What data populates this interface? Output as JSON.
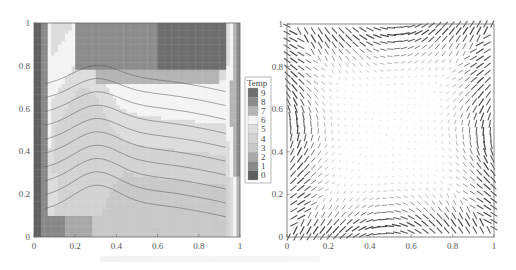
{
  "chart_data": [
    {
      "type": "heatmap",
      "subtype": "filled-contour",
      "title": "",
      "xlabel": "",
      "ylabel": "",
      "xlim": [
        0,
        1
      ],
      "ylim": [
        0,
        1
      ],
      "xticks": [
        "0",
        "0.2",
        "0.4",
        "0.6",
        "0.8",
        "1"
      ],
      "yticks": [
        "0",
        "0.2",
        "0.4",
        "0.6",
        "0.8",
        "1"
      ],
      "legend": {
        "title": "Temp",
        "placement": "right",
        "levels": [
          "9",
          "8",
          "7",
          "6",
          "5",
          "4",
          "3",
          "2",
          "1",
          "0"
        ],
        "colors": [
          "#6e6e6e",
          "#8c8c8c",
          "#b4b4b4",
          "#f4f4f4",
          "#dcdcdc",
          "#d2d2d2",
          "#c8c8c8",
          "#a8a8a8",
          "#888888",
          "#5e5e5e"
        ]
      },
      "description": "Temperature contours in unit square: hot (dark) near left wall, cold region top-right, S-shaped isotherms across interior"
    },
    {
      "type": "scatter",
      "subtype": "vector-field",
      "title": "",
      "xlabel": "",
      "ylabel": "",
      "xlim": [
        0,
        1
      ],
      "ylim": [
        0,
        1
      ],
      "xticks": [
        "0",
        "0.2",
        "0.4",
        "0.6",
        "0.8",
        "1"
      ],
      "yticks": [
        "0",
        "0.2",
        "0.4",
        "0.6",
        "0.8",
        "1"
      ],
      "description": "Velocity vectors forming a single clockwise circulation cell; strongest flow near walls, quiescent core"
    }
  ],
  "caption": ""
}
